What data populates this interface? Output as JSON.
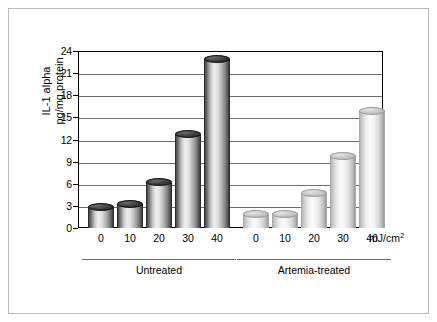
{
  "chart_data": {
    "type": "bar",
    "title": "",
    "xlabel": "",
    "ylabel": "IL-1 alpha pg/mg protein",
    "ylabel_line1": "IL-1 alpha",
    "ylabel_line2": "pg/mg protein",
    "units_label": "mJ/cm",
    "units_exponent": "2",
    "ylim": [
      0,
      24
    ],
    "ytick_labels": [
      "0",
      "3",
      "6",
      "9",
      "12",
      "15",
      "18",
      "21",
      "24"
    ],
    "ytick_values": [
      0,
      3,
      6,
      9,
      12,
      15,
      18,
      21,
      24
    ],
    "grid": true,
    "legend": "none",
    "categories": [
      "0",
      "10",
      "20",
      "30",
      "40"
    ],
    "groups": [
      {
        "name": "Untreated",
        "style": "dark",
        "bars": [
          {
            "category": "0",
            "value": 2.9
          },
          {
            "category": "10",
            "value": 3.3
          },
          {
            "category": "20",
            "value": 6.2
          },
          {
            "category": "30",
            "value": 12.8
          },
          {
            "category": "40",
            "value": 22.9
          }
        ]
      },
      {
        "name": "Artemia-treated",
        "style": "light",
        "bars": [
          {
            "category": "0",
            "value": 1.9
          },
          {
            "category": "10",
            "value": 1.9
          },
          {
            "category": "20",
            "value": 4.7
          },
          {
            "category": "30",
            "value": 9.7
          },
          {
            "category": "40",
            "value": 15.9
          }
        ]
      }
    ]
  },
  "colors": {
    "frame": "#b9b9b9",
    "axis": "#000000",
    "grid": "#6e6e6e",
    "series_dark": "#3c3c3c",
    "series_light": "#dcdcdc"
  }
}
